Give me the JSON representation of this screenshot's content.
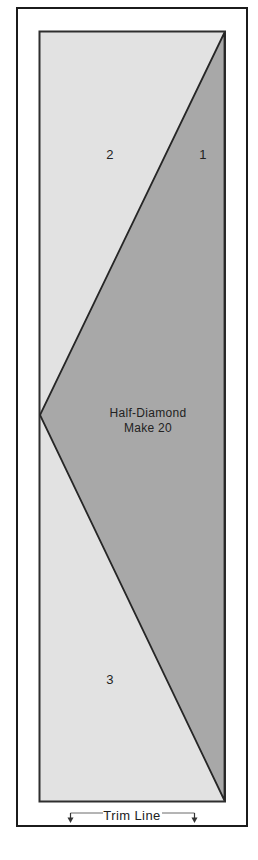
{
  "template": {
    "center_label_line1": "Half-Diamond",
    "center_label_line2": "Make 20",
    "piece_labels": {
      "p1": "1",
      "p2": "2",
      "p3": "3"
    },
    "trim_line_label": "Trim Line"
  },
  "colors": {
    "page_background": "#ffffff",
    "block_background_fill": "#e2e2e2",
    "half_diamond_fill": "#a8a8a8",
    "outline_black": "#1b1b1b",
    "inner_outline": "#2e2e2e",
    "annotation_line": "#6b6b6b",
    "text_color": "#222222"
  }
}
